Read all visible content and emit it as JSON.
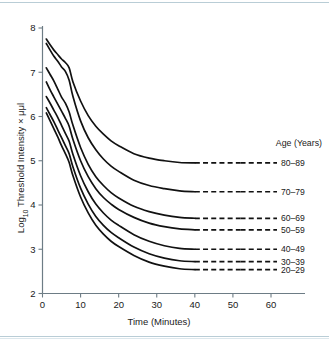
{
  "figure": {
    "name": "dark-adaptation-threshold-curves",
    "background_color": "#ffffff",
    "rule_color": "#b9cdd6",
    "ink_color": "#111111",
    "axis_color": "#6d7c85"
  },
  "chart_data": {
    "type": "line",
    "title": "",
    "xlabel": "Time (Minutes)",
    "ylabel": "Log10 Threshold Intensity × μμl",
    "ylabel_parts": {
      "log": "Log",
      "subscript": "10",
      "rest": " Threshold Intensity × μμl"
    },
    "xlim": [
      0,
      60
    ],
    "ylim": [
      2,
      8
    ],
    "xticks": [
      0,
      10,
      20,
      30,
      40,
      50,
      60
    ],
    "xtick_labels": [
      "0",
      "10",
      "20",
      "30",
      "40",
      "50",
      "60"
    ],
    "yticks": [
      2,
      3,
      4,
      5,
      6,
      7,
      8
    ],
    "ytick_labels": [
      "2",
      "3",
      "4",
      "5",
      "6",
      "7",
      "8"
    ],
    "grid": false,
    "legend_position": "right",
    "legend_title": "Age (Years)",
    "dash_start_x": 40,
    "dash_end_x": 52,
    "series": [
      {
        "name": "80–89",
        "label": "80–89",
        "plateau": 4.95,
        "x": [
          1,
          2,
          3,
          4,
          5,
          6,
          7,
          8,
          10,
          12,
          14,
          16,
          18,
          20,
          24,
          28,
          32,
          36,
          40
        ],
        "y": [
          7.75,
          7.62,
          7.5,
          7.4,
          7.3,
          7.22,
          7.1,
          6.78,
          6.35,
          6.02,
          5.78,
          5.6,
          5.45,
          5.34,
          5.16,
          5.06,
          5.0,
          4.96,
          4.95
        ],
        "legend_y": 4.95
      },
      {
        "name": "70–79",
        "label": "70–79",
        "plateau": 4.3,
        "x": [
          1,
          2,
          3,
          4,
          5,
          6,
          7,
          8,
          10,
          12,
          14,
          16,
          18,
          20,
          24,
          28,
          32,
          36,
          40
        ],
        "y": [
          7.65,
          7.5,
          7.36,
          7.25,
          7.12,
          7.02,
          6.82,
          6.45,
          5.9,
          5.52,
          5.25,
          5.04,
          4.88,
          4.76,
          4.56,
          4.44,
          4.37,
          4.32,
          4.3
        ],
        "legend_y": 4.3
      },
      {
        "name": "60–69",
        "label": "60–69",
        "plateau": 3.7,
        "x": [
          1,
          2,
          3,
          4,
          5,
          6,
          7,
          8,
          10,
          12,
          14,
          16,
          18,
          20,
          24,
          28,
          32,
          36,
          40
        ],
        "y": [
          7.1,
          6.95,
          6.8,
          6.62,
          6.44,
          6.3,
          6.1,
          5.8,
          5.3,
          4.92,
          4.64,
          4.44,
          4.28,
          4.16,
          3.97,
          3.85,
          3.77,
          3.72,
          3.7
        ],
        "legend_y": 3.7
      },
      {
        "name": "50–59",
        "label": "50–59",
        "plateau": 3.44,
        "x": [
          1,
          2,
          3,
          4,
          5,
          6,
          7,
          8,
          10,
          12,
          14,
          16,
          18,
          20,
          24,
          28,
          32,
          36,
          40
        ],
        "y": [
          6.78,
          6.6,
          6.44,
          6.28,
          6.12,
          5.96,
          5.78,
          5.48,
          5.0,
          4.64,
          4.37,
          4.17,
          4.02,
          3.9,
          3.72,
          3.59,
          3.51,
          3.46,
          3.44
        ],
        "legend_y": 3.44
      },
      {
        "name": "40–49",
        "label": "40–49",
        "plateau": 3.0,
        "x": [
          1,
          2,
          3,
          4,
          5,
          6,
          7,
          8,
          10,
          12,
          14,
          16,
          18,
          20,
          24,
          28,
          32,
          36,
          40
        ],
        "y": [
          6.45,
          6.3,
          6.14,
          5.98,
          5.8,
          5.62,
          5.44,
          5.14,
          4.66,
          4.3,
          4.02,
          3.82,
          3.66,
          3.54,
          3.33,
          3.18,
          3.08,
          3.02,
          3.0
        ],
        "legend_y": 3.0
      },
      {
        "name": "30–39",
        "label": "30–39",
        "plateau": 2.72,
        "x": [
          1,
          2,
          3,
          4,
          5,
          6,
          7,
          8,
          10,
          12,
          14,
          16,
          18,
          20,
          24,
          28,
          32,
          36,
          40
        ],
        "y": [
          6.2,
          6.04,
          5.88,
          5.7,
          5.52,
          5.34,
          5.16,
          4.86,
          4.38,
          4.02,
          3.74,
          3.54,
          3.38,
          3.26,
          3.05,
          2.9,
          2.8,
          2.74,
          2.72
        ],
        "legend_y": 2.72
      },
      {
        "name": "20–29",
        "label": "20–29",
        "plateau": 2.54,
        "x": [
          1,
          2,
          3,
          4,
          5,
          6,
          7,
          8,
          10,
          12,
          14,
          16,
          18,
          20,
          24,
          28,
          32,
          36,
          40
        ],
        "y": [
          6.08,
          5.9,
          5.72,
          5.54,
          5.34,
          5.16,
          4.96,
          4.66,
          4.18,
          3.82,
          3.54,
          3.34,
          3.18,
          3.06,
          2.86,
          2.71,
          2.62,
          2.56,
          2.54
        ],
        "legend_y": 2.54
      }
    ]
  }
}
